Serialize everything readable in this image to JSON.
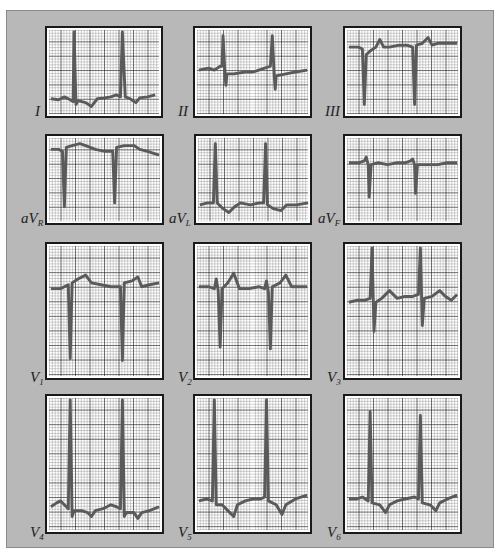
{
  "figure": {
    "colors": {
      "panel_bg": "#b8b8b8",
      "paper": "#ffffff",
      "grid_minor": "#555555",
      "grid_major": "#111111",
      "trace": "#5a5a5a"
    },
    "leads": [
      {
        "id": "I",
        "label_main": "I",
        "label_sub": "",
        "row": 0,
        "col": 0
      },
      {
        "id": "II",
        "label_main": "II",
        "label_sub": "",
        "row": 0,
        "col": 1
      },
      {
        "id": "III",
        "label_main": "III",
        "label_sub": "",
        "row": 0,
        "col": 2
      },
      {
        "id": "aVR",
        "label_main": "aV",
        "label_sub": "R",
        "row": 1,
        "col": 0
      },
      {
        "id": "aVL",
        "label_main": "aV",
        "label_sub": "L",
        "row": 1,
        "col": 1
      },
      {
        "id": "aVF",
        "label_main": "aV",
        "label_sub": "F",
        "row": 1,
        "col": 2
      },
      {
        "id": "V1",
        "label_main": "V",
        "label_sub": "1",
        "row": 2,
        "col": 0
      },
      {
        "id": "V2",
        "label_main": "V",
        "label_sub": "2",
        "row": 2,
        "col": 1
      },
      {
        "id": "V3",
        "label_main": "V",
        "label_sub": "3",
        "row": 2,
        "col": 2
      },
      {
        "id": "V4",
        "label_main": "V",
        "label_sub": "4",
        "row": 3,
        "col": 0
      },
      {
        "id": "V5",
        "label_main": "V",
        "label_sub": "5",
        "row": 3,
        "col": 1
      },
      {
        "id": "V6",
        "label_main": "V",
        "label_sub": "6",
        "row": 3,
        "col": 2
      }
    ]
  }
}
